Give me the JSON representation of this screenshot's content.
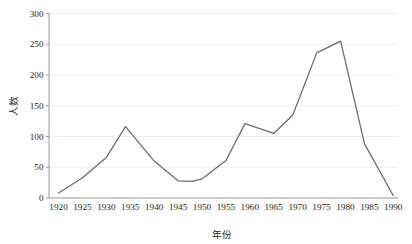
{
  "chart_data": {
    "type": "line",
    "title": "",
    "xlabel": "年份",
    "ylabel": "人数",
    "xlim": [
      1918,
      1991
    ],
    "ylim": [
      0,
      300
    ],
    "grid": true,
    "legend": false,
    "legend_position": "none",
    "line_color": "#6b6b6b",
    "grid_color": "#e8e8e8",
    "axis_color": "#8f8f8f",
    "background_color": "#ffffff",
    "xticks": [
      1920,
      1925,
      1930,
      1935,
      1940,
      1945,
      1950,
      1955,
      1960,
      1965,
      1970,
      1975,
      1980,
      1985,
      1990
    ],
    "xtick_labels": [
      "1920",
      "1925",
      "1930",
      "1935",
      "1940",
      "1945",
      "1950",
      "1955",
      "1960",
      "1965",
      "1970",
      "1975",
      "1980",
      "1985",
      "1990"
    ],
    "yticks": [
      0,
      50,
      100,
      150,
      200,
      250,
      300
    ],
    "ytick_labels": [
      "0",
      "50",
      "100",
      "150",
      "200",
      "250",
      "300"
    ],
    "series": [
      {
        "name": "人数",
        "x": [
          1920,
          1925,
          1930,
          1934,
          1940,
          1945,
          1948,
          1950,
          1955,
          1959,
          1965,
          1969,
          1974,
          1979,
          1984,
          1990
        ],
        "values": [
          8,
          33,
          66,
          116,
          60,
          28,
          27,
          31,
          61,
          121,
          105,
          135,
          236,
          255,
          88,
          4
        ]
      }
    ]
  }
}
